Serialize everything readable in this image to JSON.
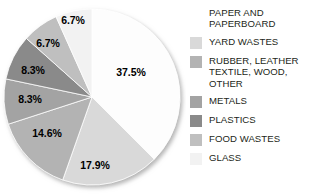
{
  "chart_data": {
    "type": "pie",
    "title": "",
    "subtitle": "",
    "xlabel": "",
    "ylabel": "",
    "grid": false,
    "legend_position": "right",
    "start_angle_deg": 0,
    "direction": "clockwise",
    "total_pct": 100.0,
    "categories": [
      "PAPER AND PAPERBOARD",
      "YARD WASTES",
      "RUBBER, LEATHER\nTEXTILE, WOOD,\nOTHER",
      "METALS",
      "PLASTICS",
      "FOOD WASTES",
      "GLASS"
    ],
    "values": [
      37.5,
      17.9,
      14.6,
      8.3,
      8.3,
      6.7,
      6.7
    ],
    "data_labels": [
      "37.5%",
      "17.9%",
      "14.6%",
      "8.3%",
      "8.3%",
      "6.7%",
      "6.7%"
    ],
    "colors": [
      "#fdfdfd",
      "#d9d9d9",
      "#b3b3b3",
      "#a3a3a3",
      "#8a8a8a",
      "#bfbfbf",
      "#f2f2f2"
    ],
    "slices": [
      {
        "label": "PAPER AND PAPERBOARD",
        "value": 37.5,
        "data_label": "37.5%",
        "color": "#fdfdfd",
        "label_x": 131,
        "label_y": 72
      },
      {
        "label": "YARD WASTES",
        "value": 17.9,
        "data_label": "17.9%",
        "color": "#d9d9d9",
        "label_x": 95,
        "label_y": 165
      },
      {
        "label": "RUBBER, LEATHER TEXTILE, WOOD, OTHER",
        "value": 14.6,
        "data_label": "14.6%",
        "color": "#b3b3b3",
        "label_x": 47,
        "label_y": 133
      },
      {
        "label": "METALS",
        "value": 8.3,
        "data_label": "8.3%",
        "color": "#a3a3a3",
        "label_x": 30,
        "label_y": 99
      },
      {
        "label": "PLASTICS",
        "value": 8.3,
        "data_label": "8.3%",
        "color": "#8a8a8a",
        "label_x": 33,
        "label_y": 70
      },
      {
        "label": "FOOD WASTES",
        "value": 6.7,
        "data_label": "6.7%",
        "color": "#bfbfbf",
        "label_x": 48,
        "label_y": 43
      },
      {
        "label": "GLASS",
        "value": 6.7,
        "data_label": "6.7%",
        "color": "#f2f2f2",
        "label_x": 73,
        "label_y": 20
      }
    ],
    "legend": [
      {
        "label": "PAPER AND\nPAPERBOARD",
        "color": "#ffffff",
        "swatch_visible": false
      },
      {
        "label": "YARD WASTES",
        "color": "#d9d9d9",
        "swatch_visible": true
      },
      {
        "label": "RUBBER, LEATHER\nTEXTILE, WOOD,\nOTHER",
        "color": "#b3b3b3",
        "swatch_visible": true
      },
      {
        "label": "METALS",
        "color": "#a3a3a3",
        "swatch_visible": true
      },
      {
        "label": "PLASTICS",
        "color": "#8a8a8a",
        "swatch_visible": true
      },
      {
        "label": "FOOD WASTES",
        "color": "#bfbfbf",
        "swatch_visible": true
      },
      {
        "label": "GLASS",
        "color": "#f2f2f2",
        "swatch_visible": true
      }
    ]
  }
}
